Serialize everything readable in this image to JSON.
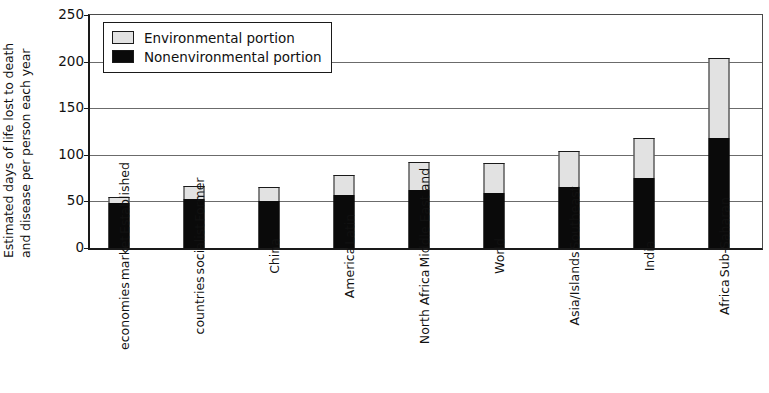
{
  "chart_data": {
    "type": "bar",
    "stacked": true,
    "title": "",
    "xlabel": "",
    "ylabel": "Estimated days of life lost to death and disease per person each year",
    "ylabel_lines": [
      "Estimated days of life lost to death",
      "and disease per person each year"
    ],
    "ylim": [
      0,
      250
    ],
    "yticks": [
      0,
      50,
      100,
      150,
      200,
      250
    ],
    "ytick_labels": [
      "0",
      "50",
      "100",
      "150",
      "200",
      "250"
    ],
    "grid": "horizontal",
    "legend_position": "upper left",
    "categories": [
      "Established market economies",
      "Former socialist countries",
      "China",
      "Latin America",
      "Middle East and North Africa",
      "World",
      "Southeast Asia/Islands",
      "India",
      "Sub-Saharan Africa"
    ],
    "category_lines": [
      [
        "Established",
        "market",
        "economies"
      ],
      [
        "Former",
        "socialist",
        "countries"
      ],
      [
        "China"
      ],
      [
        "Latin",
        "America"
      ],
      [
        "Middle East and",
        "North Africa"
      ],
      [
        "World"
      ],
      [
        "Southeast",
        "Asia/Islands"
      ],
      [
        "India"
      ],
      [
        "Sub-Saharan",
        "Africa"
      ]
    ],
    "series": [
      {
        "name": "Nonenvironmental portion",
        "color": "#0a0a0a",
        "values": [
          48,
          53,
          50,
          57,
          62,
          59,
          65,
          75,
          118
        ]
      },
      {
        "name": "Environmental portion",
        "color": "#e2e2e2",
        "values": [
          7,
          14,
          16,
          21,
          30,
          32,
          39,
          43,
          86
        ]
      }
    ],
    "totals": [
      55,
      67,
      66,
      78,
      92,
      91,
      104,
      118,
      204
    ]
  },
  "legend": {
    "items": [
      {
        "label": "Environmental portion",
        "swatch": "env"
      },
      {
        "label": "Nonenvironmental portion",
        "swatch": "nonenv"
      }
    ]
  },
  "caption_fragment": ""
}
